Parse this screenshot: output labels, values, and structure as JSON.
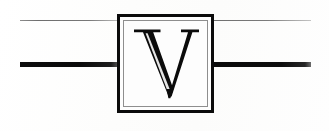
{
  "page": {
    "kind": "scanned-decorative-initial",
    "width": 329,
    "height": 131,
    "background_color": "#fdfdfd"
  },
  "initial": {
    "letter": "V",
    "style": "serif-capital",
    "ink_color": "#0b0b0b",
    "frame": {
      "outer_border_color": "#0b0b0b",
      "inner_border_color": "#8e8e8e",
      "fill_color": "#fdfdfd"
    }
  },
  "rules": {
    "thin_left": {
      "label": "thin-rule-left",
      "color": "#6e6e6e"
    },
    "thin_right": {
      "label": "thin-rule-right",
      "color": "#787878"
    },
    "thick_left": {
      "label": "thick-rule-left",
      "color": "#0a0a0a"
    },
    "thick_right": {
      "label": "thick-rule-right",
      "color": "#0d0d0d"
    }
  },
  "bleed_through": {
    "line_one": "",
    "line_two": ""
  }
}
